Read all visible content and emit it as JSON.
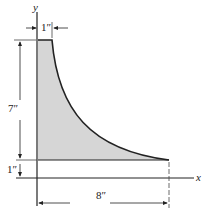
{
  "diagram": {
    "axes": {
      "x_label": "x",
      "y_label": "y"
    },
    "dimensions": {
      "top_width": "1″",
      "height": "7″",
      "offset": "1″",
      "length": "8″"
    },
    "colors": {
      "fill": "#d4d4d4",
      "stroke": "#222222"
    }
  }
}
